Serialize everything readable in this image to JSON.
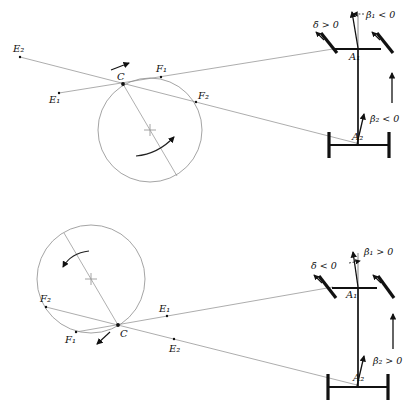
{
  "figure_top": {
    "description": "kinematic diagram, positive steering rate",
    "labels": {
      "E2": "E₂",
      "E1": "E₁",
      "C": "C",
      "F1": "F₁",
      "F2": "F₂",
      "delta": "δ̇ > 0",
      "beta1": "β̇₁ < 0",
      "A1": "A₁",
      "beta2": "β̇₂ < 0",
      "A2": "A₂"
    }
  },
  "figure_bottom": {
    "description": "kinematic diagram, negative steering rate",
    "labels": {
      "E2": "E₂",
      "E1": "E₁",
      "C": "C",
      "F1": "F₁",
      "F2": "F₂",
      "delta": "δ̇ < 0",
      "beta1": "β̇₁ > 0",
      "A1": "A₁",
      "beta2": "β̇₂ > 0",
      "A2": "A₂"
    }
  }
}
